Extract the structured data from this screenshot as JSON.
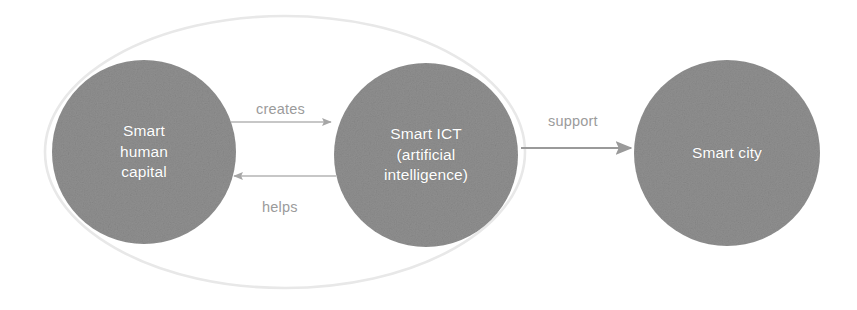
{
  "diagram": {
    "type": "concept-diagram",
    "background_color": "#ffffff",
    "node_fill_color": "#8f8f8f",
    "node_text_color": "#ffffff",
    "edge_color": "#a6a6a6",
    "edge_label_color": "#9b9b9b",
    "grouping_outline_color": "#dcdcdc",
    "nodes": [
      {
        "id": "smart-human-capital",
        "label": "Smart\nhuman\ncapital",
        "lines": [
          "Smart",
          "human",
          "capital"
        ],
        "shape": "circle",
        "cx": 144,
        "cy": 152,
        "r": 92
      },
      {
        "id": "smart-ict",
        "label": "Smart ICT\n(artificial\nintelligence)",
        "lines": [
          "Smart ICT",
          "(artificial",
          "intelligence)"
        ],
        "shape": "circle",
        "cx": 426,
        "cy": 155,
        "r": 92
      },
      {
        "id": "smart-city",
        "label": "Smart city",
        "lines": [
          "Smart city"
        ],
        "shape": "circle",
        "cx": 727,
        "cy": 153,
        "r": 93
      }
    ],
    "edges": [
      {
        "id": "creates",
        "label": "creates",
        "from": "smart-human-capital",
        "to": "smart-ict",
        "direction": "right"
      },
      {
        "id": "helps",
        "label": "helps",
        "from": "smart-ict",
        "to": "smart-human-capital",
        "direction": "left"
      },
      {
        "id": "support",
        "label": "support",
        "from": "smart-ict",
        "to": "smart-city",
        "direction": "right"
      }
    ],
    "grouping": {
      "id": "smart-human-ict-group",
      "shape": "ellipse",
      "cx": 285,
      "cy": 152,
      "rx": 240,
      "ry": 136
    }
  }
}
